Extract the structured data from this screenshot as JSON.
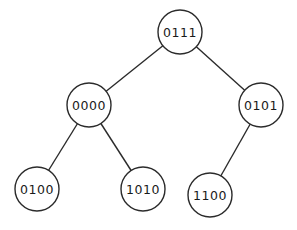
{
  "tree": {
    "nodes": [
      {
        "id": "n0111",
        "label": "0111",
        "parent": null
      },
      {
        "id": "n0000",
        "label": "0000",
        "parent": "n0111"
      },
      {
        "id": "n0101",
        "label": "0101",
        "parent": "n0111"
      },
      {
        "id": "n0100",
        "label": "0100",
        "parent": "n0000"
      },
      {
        "id": "n1010",
        "label": "1010",
        "parent": "n0000"
      },
      {
        "id": "n1100",
        "label": "1100",
        "parent": "n0101"
      }
    ]
  }
}
